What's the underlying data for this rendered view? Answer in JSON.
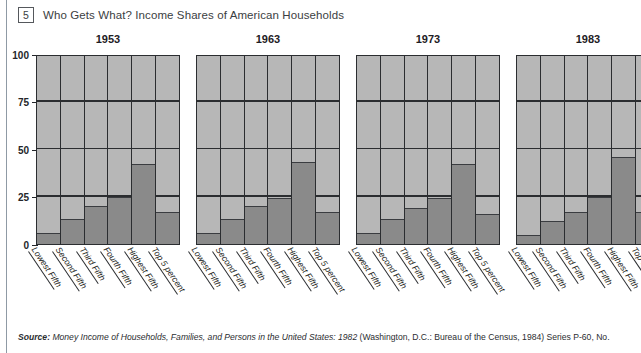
{
  "figure": {
    "number": "5",
    "title": "Who Gets What? Income Shares of American Households"
  },
  "source": {
    "lead": "Source:",
    "italic_part": "Money Income of Households, Families, and Persons in the United States: 1982",
    "rest": " (Washington, D.C.: Bureau of the Census, 1984) Series P-60, No."
  },
  "colors": {
    "plot_background": "#b7b7b7",
    "bar_fill": "#8a8a8a",
    "axis": "#2b2d30",
    "rule": "#8f9aa5",
    "text": "#3b3e42"
  },
  "chart_data": {
    "type": "bar",
    "title": "Who Gets What? Income Shares of American Households",
    "xlabel": "",
    "ylabel": "",
    "ylim": [
      0,
      100
    ],
    "yticks": [
      0,
      25,
      50,
      75,
      100
    ],
    "grid": true,
    "legend": "none",
    "panels": [
      "1953",
      "1963",
      "1973",
      "1983"
    ],
    "categories": [
      "Lowest Fifth",
      "Second Fifth",
      "Third Fifth",
      "Fourth Fifth",
      "Highest Fifth",
      "Top 5 percent"
    ],
    "series": [
      {
        "name": "1953",
        "values": [
          6,
          13,
          20,
          25,
          42,
          17
        ]
      },
      {
        "name": "1963",
        "values": [
          6,
          13,
          20,
          24,
          43,
          17
        ]
      },
      {
        "name": "1973",
        "values": [
          6,
          13,
          19,
          24,
          42,
          16
        ]
      },
      {
        "name": "1983",
        "values": [
          5,
          12,
          17,
          25,
          46,
          17
        ]
      }
    ]
  }
}
